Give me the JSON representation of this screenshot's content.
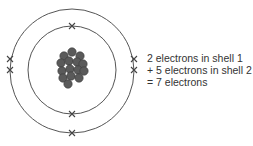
{
  "diagram": {
    "colors": {
      "shell": "#555555",
      "electron": "#444444",
      "nucleus": "#5a5a5a",
      "text": "#333333"
    },
    "nucleus": {
      "particles": [
        [
          72,
          52
        ],
        [
          64,
          56
        ],
        [
          80,
          56
        ],
        [
          61,
          63
        ],
        [
          69,
          61
        ],
        [
          77,
          62
        ],
        [
          83,
          64
        ],
        [
          62,
          71
        ],
        [
          70,
          69
        ],
        [
          78,
          70
        ],
        [
          84,
          71
        ],
        [
          63,
          78
        ],
        [
          71,
          76
        ],
        [
          79,
          78
        ],
        [
          68,
          84
        ]
      ]
    },
    "shells": [
      {
        "name": "shell 1",
        "radius": 44,
        "electrons": 2
      },
      {
        "name": "shell 2",
        "radius": 63,
        "electrons": 5
      }
    ]
  },
  "caption": {
    "line1": "2 electrons in shell 1",
    "line2": "+ 5 electrons in shell 2",
    "line3": "= 7 electrons"
  }
}
